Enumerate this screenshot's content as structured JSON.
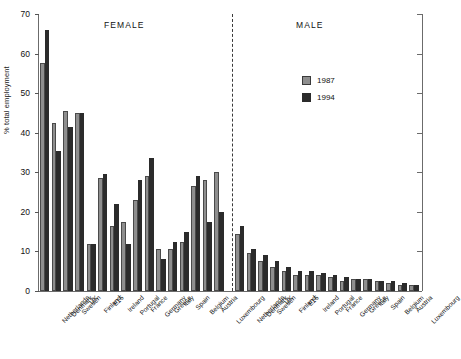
{
  "chart_data": {
    "type": "bar",
    "title": "",
    "xlabel": "",
    "ylabel": "% total employment",
    "ylim": [
      0,
      70
    ],
    "yticks": [
      0,
      10,
      20,
      30,
      40,
      50,
      60,
      70
    ],
    "grid": false,
    "legend_position": "upper-right",
    "panels": [
      {
        "label": "FEMALE",
        "categories": [
          "Netherlands",
          "Denmark",
          "Sweden",
          "UK",
          "Finland",
          "E15",
          "Ireland",
          "Portugal",
          "France",
          "Germany",
          "Greece",
          "Italy",
          "Spain",
          "Belgium",
          "Austria",
          "Luxembourg"
        ],
        "series": [
          {
            "name": "1987",
            "values": [
              57.5,
              42.5,
              45.5,
              45.0,
              12.0,
              28.5,
              16.5,
              17.5,
              23.0,
              29.0,
              10.5,
              10.5,
              12.5,
              26.5,
              28.0,
              30.0
            ]
          },
          {
            "name": "1994",
            "values": [
              66.0,
              35.5,
              41.5,
              45.0,
              12.0,
              29.5,
              22.0,
              12.0,
              28.0,
              33.5,
              8.0,
              12.5,
              15.0,
              29.0,
              17.5,
              20.0
            ]
          }
        ]
      },
      {
        "label": "MALE",
        "categories": [
          "Netherlands",
          "Denmark",
          "Sweden",
          "UK",
          "Finland",
          "E15",
          "Ireland",
          "Portugal",
          "France",
          "Germany",
          "Greece",
          "Italy",
          "Spain",
          "Belgium",
          "Austria",
          "Luxembourg"
        ],
        "series": [
          {
            "name": "1987",
            "values": [
              14.5,
              9.5,
              7.5,
              6.0,
              5.0,
              4.0,
              4.0,
              4.0,
              3.5,
              2.5,
              3.0,
              3.0,
              2.5,
              2.0,
              1.5,
              1.5
            ]
          },
          {
            "name": "1994",
            "values": [
              16.5,
              10.5,
              9.0,
              7.5,
              6.0,
              5.0,
              5.0,
              4.5,
              4.0,
              3.5,
              3.0,
              3.0,
              2.5,
              2.5,
              2.0,
              1.5
            ]
          }
        ]
      }
    ],
    "legend": [
      "1987",
      "1994"
    ],
    "colors": {
      "y1987": "#8e8e8e",
      "y1994": "#2b2b2b"
    }
  }
}
